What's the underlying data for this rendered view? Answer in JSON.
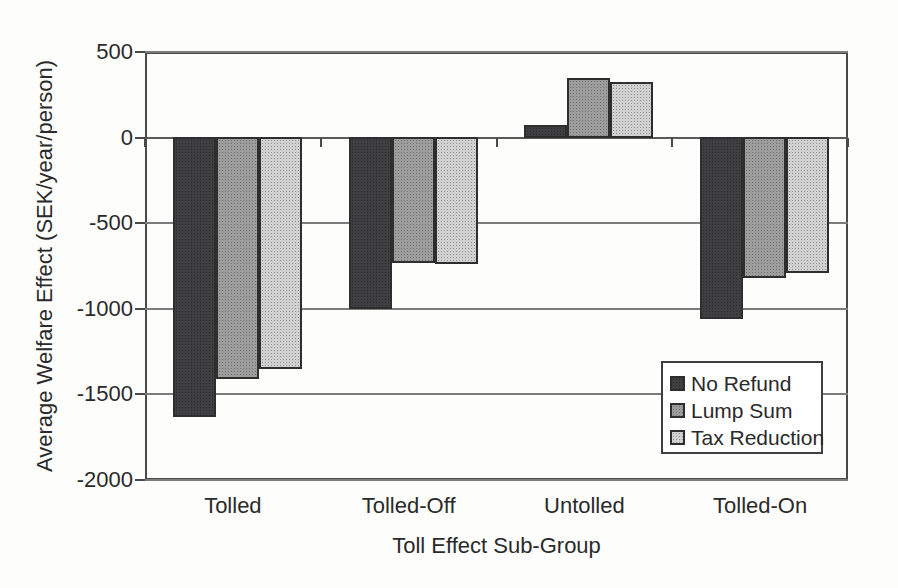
{
  "chart_data": {
    "type": "bar",
    "title": "",
    "xlabel": "Toll Effect Sub-Group",
    "ylabel": "Average Welfare Effect (SEK/year/person)",
    "categories": [
      "Tolled",
      "Tolled-Off",
      "Untolled",
      "Tolled-On"
    ],
    "series": [
      {
        "name": "No Refund",
        "color": "#3f3f41",
        "values": [
          -1630,
          -1000,
          70,
          -1060
        ]
      },
      {
        "name": "Lump Sum",
        "color": "#9d9d9d",
        "values": [
          -1410,
          -730,
          340,
          -820
        ]
      },
      {
        "name": "Tax Reduction",
        "color": "#d0d0d0",
        "values": [
          -1350,
          -740,
          320,
          -790
        ]
      }
    ],
    "y_ticks": [
      500,
      0,
      -500,
      -1000,
      -1500,
      -2000
    ],
    "ylim": [
      -2000,
      500
    ],
    "grid": true,
    "legend_position": "inside-right",
    "legend_labels": [
      "No Refund",
      "Lump Sum",
      "Tax Reduction"
    ]
  },
  "colors": {
    "grid": "#7c7c7c",
    "axis": "#4a4a4a",
    "text": "#2a2a2a",
    "background": "#fdfdfc",
    "legend_background": "#fefefe"
  }
}
